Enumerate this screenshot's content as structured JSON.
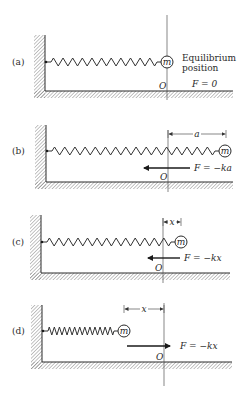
{
  "figure": {
    "origin_label": "O",
    "colors": {
      "ink": "#2a2a2a",
      "hatch": "#7a7a7a",
      "background": "#ffffff"
    },
    "panels": [
      {
        "id": "a",
        "label": "(a)",
        "mass_label": "m",
        "wall_x": 45,
        "wall_top": 35,
        "floor_y": 91,
        "floor_end": 233,
        "spring_y": 62,
        "spring_start": 47,
        "mass_cx": 167,
        "mass_r": 6,
        "coils": 11,
        "origin_x": 167,
        "origin_top": 15,
        "origin_bottom": 100,
        "side_text": [
          "Equilibrium",
          "position"
        ],
        "force_label": "F = 0",
        "arrow": null,
        "dimension": null
      },
      {
        "id": "b",
        "label": "(b)",
        "mass_label": "m",
        "wall_x": 46,
        "wall_top": 125,
        "floor_y": 182,
        "floor_end": 233,
        "spring_y": 151,
        "spring_start": 48,
        "mass_cx": 225,
        "mass_r": 6,
        "coils": 16,
        "origin_x": 168,
        "origin_top": 130,
        "origin_bottom": 192,
        "force_label": "F = −ka",
        "arrow": {
          "from": 190,
          "to": 144,
          "y": 168
        },
        "dimension": {
          "from": 168,
          "to": 226,
          "y": 134,
          "label": "a"
        }
      },
      {
        "id": "c",
        "label": "(c)",
        "mass_label": "m",
        "wall_x": 41,
        "wall_top": 215,
        "floor_y": 273,
        "floor_end": 230,
        "spring_y": 242,
        "spring_start": 43,
        "mass_cx": 181,
        "mass_r": 6,
        "coils": 13,
        "origin_x": 163,
        "origin_top": 218,
        "origin_bottom": 283,
        "force_label": "F = −kx",
        "arrow": {
          "from": 180,
          "to": 148,
          "y": 258
        },
        "dimension": {
          "from": 163,
          "to": 181,
          "y": 222,
          "label": "x"
        }
      },
      {
        "id": "d",
        "label": "(d)",
        "mass_label": "m",
        "wall_x": 42,
        "wall_top": 305,
        "floor_y": 362,
        "floor_end": 232,
        "spring_y": 331,
        "spring_start": 44,
        "mass_cx": 124,
        "mass_r": 6,
        "coils": 13,
        "origin_x": 164,
        "origin_top": 303,
        "origin_bottom": 386,
        "force_label": "F = −kx",
        "arrow": {
          "from": 127,
          "to": 170,
          "y": 346
        },
        "dimension": {
          "from": 124,
          "to": 164,
          "y": 309,
          "label": "x"
        }
      }
    ]
  }
}
